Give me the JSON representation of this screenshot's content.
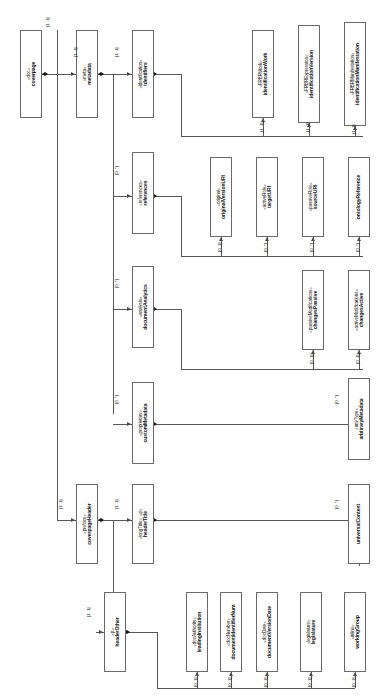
{
  "diagram": {
    "kind": "uml-class-diagram",
    "orientation": "text-rotated-90-ccw",
    "colors": {
      "box_border": "#6a6a6a",
      "box_fill": "#ffffff",
      "line": "#585858",
      "diamond": "#1b1b1b",
      "text": "#101010",
      "background": "#ffffff"
    },
    "nodes": [
      {
        "id": "coverpage",
        "stereotype": "«doc»",
        "name": "coverpage",
        "x": 20,
        "y": 30,
        "w": 22,
        "h": 88
      },
      {
        "id": "metadata",
        "stereotype": "«meta»",
        "name": "metadata",
        "x": 76,
        "y": 30,
        "w": 22,
        "h": 88
      },
      {
        "id": "identifiers",
        "stereotype": "«identification»",
        "name": "identifiers",
        "x": 132,
        "y": 30,
        "w": 22,
        "h": 88
      },
      {
        "id": "identificationWork",
        "stereotype": "«FRBRWork»",
        "name": "identificationWork",
        "x": 252,
        "y": 30,
        "w": 22,
        "h": 88
      },
      {
        "id": "identificationVersion",
        "stereotype": "«FRBRExpression»",
        "name": "identificationVersion",
        "x": 298,
        "y": 25,
        "w": 22,
        "h": 98
      },
      {
        "id": "identificationManifestation",
        "stereotype": "«FRBRManifestation»",
        "name": "identificationManifestation",
        "x": 344,
        "y": 22,
        "w": 22,
        "h": 104
      },
      {
        "id": "references",
        "stereotype": "«references»",
        "name": "references",
        "x": 132,
        "y": 152,
        "w": 22,
        "h": 82
      },
      {
        "id": "originalVersionURI",
        "stereotype": "«original»",
        "name": "originalVersionURI",
        "x": 210,
        "y": 157,
        "w": 22,
        "h": 80
      },
      {
        "id": "targetURI",
        "stereotype": "«activeRole»",
        "name": "targetURI",
        "x": 256,
        "y": 157,
        "w": 22,
        "h": 80
      },
      {
        "id": "sourceURI",
        "stereotype": "«passiveRole»",
        "name": "sourceURI",
        "x": 302,
        "y": 157,
        "w": 22,
        "h": 80
      },
      {
        "id": "ontologyReference",
        "stereotype": "",
        "name": "ontologyReference",
        "x": 348,
        "y": 157,
        "w": 22,
        "h": 80
      },
      {
        "id": "documentAnalytics",
        "stereotype": "«analysis»",
        "name": "documentAnalytics",
        "x": 132,
        "y": 266,
        "w": 22,
        "h": 82
      },
      {
        "id": "changesPassive",
        "stereotype": "«passiveModifications»",
        "name": "changesPassive",
        "x": 302,
        "y": 270,
        "w": 22,
        "h": 80
      },
      {
        "id": "changesActive",
        "stereotype": "«activeModifications»",
        "name": "changesActive",
        "x": 348,
        "y": 270,
        "w": 22,
        "h": 80
      },
      {
        "id": "customMetadata",
        "stereotype": "«proprietary»",
        "name": "customMetadata",
        "x": 132,
        "y": 382,
        "w": 22,
        "h": 82
      },
      {
        "id": "arbitraryMetadata",
        "stereotype": "«anyType»",
        "name": "arbitraryMetadata",
        "x": 348,
        "y": 378,
        "w": 22,
        "h": 82
      },
      {
        "id": "coverpageHeader",
        "stereotype": "«preface»",
        "name": "coverpageHeader",
        "x": 76,
        "y": 484,
        "w": 22,
        "h": 80
      },
      {
        "id": "headerTitle",
        "stereotype": "«longTitle», «p»",
        "name": "headerTitle",
        "x": 132,
        "y": 484,
        "w": 22,
        "h": 80
      },
      {
        "id": "universalContent",
        "stereotype": "",
        "name": "universalContent",
        "x": 348,
        "y": 484,
        "w": 22,
        "h": 80
      },
      {
        "id": "headerOther",
        "stereotype": "«p»",
        "name": "headerOther",
        "x": 104,
        "y": 592,
        "w": 22,
        "h": 80
      },
      {
        "id": "leadingInstitution",
        "stereotype": "«docAuthority»",
        "name": "leadingInstitution",
        "x": 186,
        "y": 592,
        "w": 22,
        "h": 80
      },
      {
        "id": "documentIdentifierNum",
        "stereotype": "«docNumber»",
        "name": "documentIdentifierNum",
        "x": 220,
        "y": 592,
        "w": 22,
        "h": 80
      },
      {
        "id": "documentVersionDate",
        "stereotype": "«docDate»",
        "name": "documentVersionDate",
        "x": 256,
        "y": 592,
        "w": 22,
        "h": 80
      },
      {
        "id": "legislature",
        "stereotype": "«legislature»",
        "name": "legislature",
        "x": 300,
        "y": 592,
        "w": 22,
        "h": 80
      },
      {
        "id": "workingGroup",
        "stereotype": "«inline»",
        "name": "workingGroup",
        "x": 344,
        "y": 592,
        "w": 22,
        "h": 80
      }
    ],
    "multiplicities": [
      {
        "id": "m-coverpage-root",
        "label": "[1..1]",
        "x": 45,
        "y": 27
      },
      {
        "id": "m-metadata",
        "label": "[1..1]",
        "x": 73,
        "y": 57
      },
      {
        "id": "m-identifiers",
        "label": "[1..1]",
        "x": 114,
        "y": 57
      },
      {
        "id": "m-idwork",
        "label": "[1..1]",
        "x": 259,
        "y": 132
      },
      {
        "id": "m-idversion",
        "label": "[1..1]",
        "x": 305,
        "y": 132
      },
      {
        "id": "m-idmanifest",
        "label": "[1..1]",
        "x": 351,
        "y": 134
      },
      {
        "id": "m-references",
        "label": "[0..*]",
        "x": 114,
        "y": 175
      },
      {
        "id": "m-originaluri",
        "label": "[0..1]",
        "x": 217,
        "y": 252
      },
      {
        "id": "m-targeturi",
        "label": "[0..*]",
        "x": 263,
        "y": 252
      },
      {
        "id": "m-sourceuri",
        "label": "[0..*]",
        "x": 309,
        "y": 252
      },
      {
        "id": "m-ontology",
        "label": "[0..*]",
        "x": 355,
        "y": 252
      },
      {
        "id": "m-analysis",
        "label": "[0..*]",
        "x": 114,
        "y": 288
      },
      {
        "id": "m-changespassive",
        "label": "[0..1]",
        "x": 309,
        "y": 364
      },
      {
        "id": "m-changesactive",
        "label": "[0..1]",
        "x": 355,
        "y": 364
      },
      {
        "id": "m-custommeta",
        "label": "[0..*]",
        "x": 114,
        "y": 404
      },
      {
        "id": "m-arbitrary",
        "label": "[0..*]",
        "x": 334,
        "y": 404
      },
      {
        "id": "m-coverpageheader",
        "label": "[1..1]",
        "x": 58,
        "y": 509
      },
      {
        "id": "m-headertitle",
        "label": "[1..1]",
        "x": 114,
        "y": 509
      },
      {
        "id": "m-universalcontent",
        "label": "[0..*]",
        "x": 334,
        "y": 509
      },
      {
        "id": "m-headerother",
        "label": "[1..1]",
        "x": 86,
        "y": 617
      },
      {
        "id": "m-leading",
        "label": "[0..1]",
        "x": 193,
        "y": 687
      },
      {
        "id": "m-docnum",
        "label": "[0..1]",
        "x": 227,
        "y": 687
      },
      {
        "id": "m-docdate",
        "label": "[0..1]",
        "x": 263,
        "y": 687
      },
      {
        "id": "m-legislature",
        "label": "[0..1]",
        "x": 307,
        "y": 687
      },
      {
        "id": "m-workinggroup",
        "label": "[0..1]",
        "x": 351,
        "y": 687
      }
    ]
  }
}
